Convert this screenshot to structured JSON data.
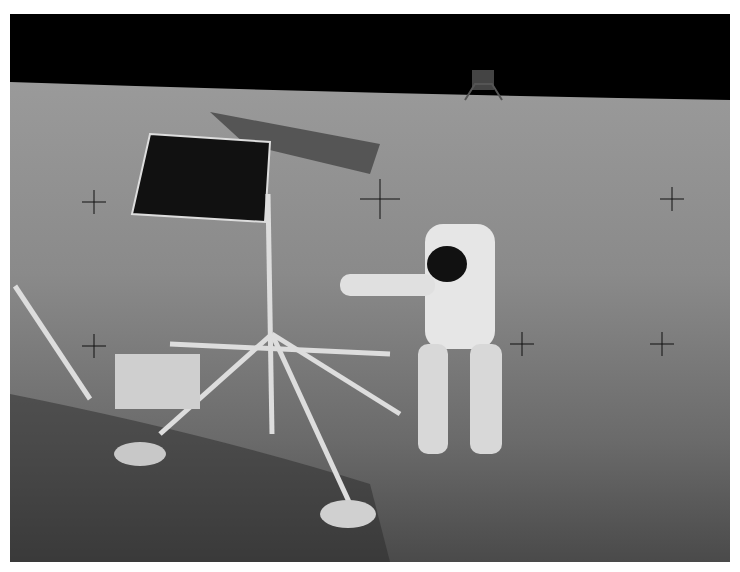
{
  "image": {
    "description": "Black-and-white lunar surface photograph: astronaut in spacesuit standing beside a spacecraft lander with a solar panel; a second lander on the horizon against black sky; reticle crosshairs overlaid",
    "colors": {
      "sky": "#000000",
      "surface_far": "#8a8a8a",
      "surface_near": "#5a5a5a",
      "suit": "#e6e6e6",
      "shadow": "#1a1a1a"
    }
  }
}
